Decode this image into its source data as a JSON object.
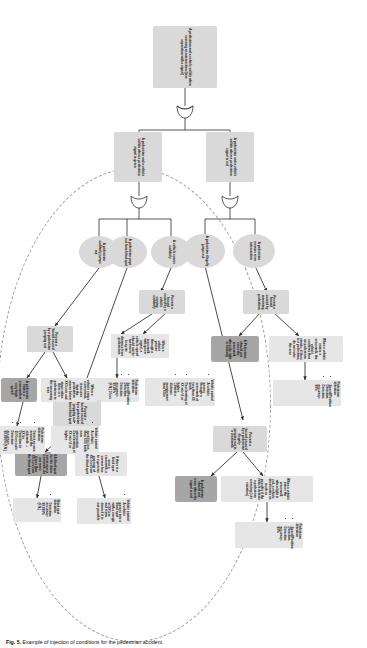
{
  "figure": {
    "caption_label": "Fig. 5.",
    "caption_text": "Example of injection of conditions for the pedestrian accident."
  },
  "diagram": {
    "type": "safety-argument-fault-tree",
    "nodes": [
      {
        "id": "n01",
        "kind": "goal",
        "text": "A pedestrian and a vehicle collide when crossing an intersection (time separation with a signal)"
      },
      {
        "id": "n02",
        "kind": "goal",
        "text": "A pedestrian and a vehicle collide when a pedestrian signal is red"
      },
      {
        "id": "n03",
        "kind": "goal",
        "text": "A pedestrian and a vehicle collide when a pedestrian signal is green"
      },
      {
        "id": "n04",
        "kind": "event",
        "text": "A pedestrian illegally jumps out"
      },
      {
        "id": "n05",
        "kind": "event",
        "text": "A pedestrian remains at an intersection"
      },
      {
        "id": "n06",
        "kind": "strategy",
        "text": "Prevent a hazard caused by remaining pedestrian"
      },
      {
        "id": "n07",
        "kind": "context",
        "text": "When a vehicle enters a crosswalk, the vehicle confirms that no pedestrian stands; if there is a pedestrian, do not enter the area"
      },
      {
        "id": "n08",
        "kind": "solution",
        "text": "A Pedestrian should not cross the crosswalk when the light is blinking"
      },
      {
        "id": "n09",
        "kind": "spec",
        "title": "Pedestrian detection",
        "items": [
          "Speed/Position Detection",
          "Detection accuracy: 99%"
        ]
      },
      {
        "id": "n10",
        "kind": "strategy",
        "text": "Prevent a hazard caused by a pedestrian illegally jumping out in a crosswalk"
      },
      {
        "id": "n11",
        "kind": "context",
        "text": "When a vehicle enters the crosswalk when light is red, a vehicle decelerates as much as possible if the vehicle detects a pedestrian crossing (rule violation)"
      },
      {
        "id": "n12",
        "kind": "solution",
        "text": "A pedestrian should not cross when the signal is red"
      },
      {
        "id": "n13",
        "kind": "spec",
        "title": "Pedestrian detection",
        "items": [
          "Speed/Position Detection",
          "Detection accuracy: 99%"
        ]
      },
      {
        "id": "n14",
        "kind": "event",
        "text": "A vehicle comes suddenly"
      },
      {
        "id": "n15",
        "kind": "event",
        "text": "A pedestrian pops out from blind spot"
      },
      {
        "id": "n16",
        "kind": "event",
        "text": "A pedestrian suddenly jumps out"
      },
      {
        "id": "n17",
        "kind": "strategy",
        "text": "Prevent a hazard caused by a vehicle coming suddenly"
      },
      {
        "id": "n18",
        "kind": "context",
        "text": "When a vehicle passes through a crosswalk with green signal, a vehicle speed should not be too fast to keep its distance from pedestrians"
      },
      {
        "id": "n19",
        "kind": "spec",
        "title": "Pedestrian detection",
        "items": [
          "Speed/Position Detection",
          "Detection accuracy: 99.99% (F.N.) 50cm"
        ]
      },
      {
        "id": "n20",
        "kind": "spec",
        "title": "Vehicle control",
        "items": [
          "A vehicle passes through a crosswalk at less than XX km/h",
          "Decelerating at XX m/s^2 or higher",
          "Control a distance margin more than XXm"
        ]
      },
      {
        "id": "n21",
        "kind": "strategy",
        "text": "Prevent a hazard caused by a pedestrian popping out from blind spot"
      },
      {
        "id": "n22",
        "kind": "context",
        "text": "If there is a blind spot near a crosswalk, a camera has to supervise passage of XX.0cm from the blind spot"
      },
      {
        "id": "n23",
        "kind": "solution",
        "text": "If A blind spot for the driver exists near a crosswalk, do not move closer than XX.0cm from the blind spot"
      },
      {
        "id": "n24",
        "kind": "spec",
        "title": "Blind spot detection",
        "items": [
          "Detection accuracy: 99.999% (F.N.)"
        ]
      },
      {
        "id": "n25",
        "kind": "spec",
        "title": "Vehicle control",
        "items": [
          "A vehicle passes into a blind spot with a margin of XX0cm and slows down if it is not possible"
        ]
      },
      {
        "id": "n26",
        "kind": "strategy",
        "text": "Prevent a hazard caused by a pedestrian jumping out"
      },
      {
        "id": "n27",
        "kind": "context",
        "text": "When a vehicle enters a crosswalk, it ensures that the pedestrian moves below XX0cm/s and stops when there is a pedestrian in the oncoming area"
      },
      {
        "id": "n28",
        "kind": "solution",
        "text": "A pedestrian enters a crosswalk at very high speed"
      },
      {
        "id": "n29",
        "kind": "spec",
        "title": "Pedestrian detection",
        "items": [
          "Detect an area around the sidewalk: + XX0m",
          "Detection in 1100cm cycle",
          "Detection accuracy: 99.999% (F.N.)"
        ]
      },
      {
        "id": "n30",
        "kind": "spec",
        "title": "Vehicle control",
        "items": [
          "A vehicle speed is less than XXX km/h near intersection",
          "Decelerating at XX m/s^2 or higher"
        ]
      }
    ],
    "gates": [
      {
        "id": "gate1",
        "type": "OR"
      },
      {
        "id": "gate2",
        "type": "OR"
      }
    ],
    "boundary": {
      "type": "dashed-ellipse",
      "label": ""
    }
  }
}
